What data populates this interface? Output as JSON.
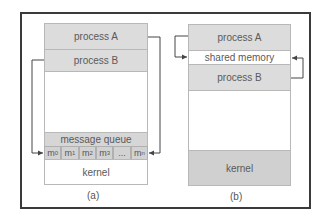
{
  "diagrams": {
    "a": {
      "caption": "(a)",
      "process_a": "process A",
      "process_b": "process B",
      "message_queue": "message queue",
      "cells": [
        {
          "base": "m",
          "sub": "0"
        },
        {
          "base": "m",
          "sub": "1"
        },
        {
          "base": "m",
          "sub": "2"
        },
        {
          "base": "m",
          "sub": "3"
        },
        {
          "base": "...",
          "sub": ""
        },
        {
          "base": "m",
          "sub": "n"
        }
      ],
      "kernel": "kernel"
    },
    "b": {
      "caption": "(b)",
      "process_a": "process A",
      "shared_memory": "shared memory",
      "process_b": "process B",
      "kernel": "kernel"
    }
  },
  "colors": {
    "shaded": "#dcdcdc",
    "kernel_b": "#d0d0d0",
    "frame": "#3a3a3a",
    "arrow": "#444444"
  }
}
